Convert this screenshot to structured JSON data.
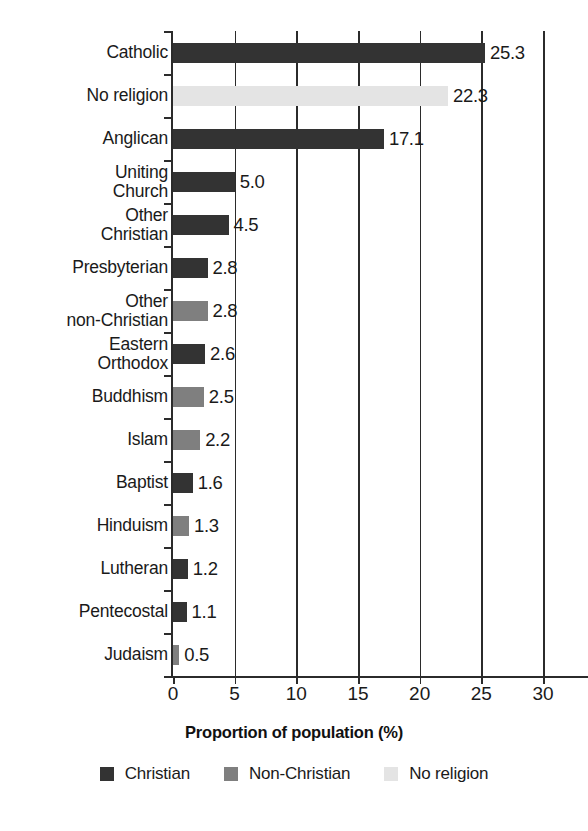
{
  "chart_data": {
    "type": "bar",
    "orientation": "horizontal",
    "title": "",
    "xlabel": "Proportion of population (%)",
    "ylabel": "",
    "xlim": [
      0,
      30
    ],
    "xticks": [
      "0",
      "5",
      "10",
      "15",
      "20",
      "25",
      "30"
    ],
    "grid": true,
    "legend_position": "bottom",
    "categories": [
      "Catholic",
      "No religion",
      "Anglican",
      "Uniting\nChurch",
      "Other\nChristian",
      "Presbyterian",
      "Other\nnon-Christian",
      "Eastern\nOrthodox",
      "Buddhism",
      "Islam",
      "Baptist",
      "Hinduism",
      "Lutheran",
      "Pentecostal",
      "Judaism"
    ],
    "values": [
      25.3,
      22.3,
      17.1,
      5.0,
      4.5,
      2.8,
      2.8,
      2.6,
      2.5,
      2.2,
      1.6,
      1.3,
      1.2,
      1.1,
      0.5
    ],
    "value_labels": [
      "25.3",
      "22.3",
      "17.1",
      "5.0",
      "4.5",
      "2.8",
      "2.8",
      "2.6",
      "2.5",
      "2.2",
      "1.6",
      "1.3",
      "1.2",
      "1.1",
      "0.5"
    ],
    "groups": [
      "Christian",
      "No religion",
      "Christian",
      "Christian",
      "Christian",
      "Christian",
      "Non-Christian",
      "Christian",
      "Non-Christian",
      "Non-Christian",
      "Christian",
      "Non-Christian",
      "Christian",
      "Christian",
      "Non-Christian"
    ],
    "legend": [
      {
        "label": "Christian",
        "color": "#333333",
        "key": "christian"
      },
      {
        "label": "Non-Christian",
        "color": "#7f7f7f",
        "key": "nonchristian"
      },
      {
        "label": "No religion",
        "color": "#e4e4e4",
        "key": "noreligion"
      }
    ],
    "colors": {
      "christian": "#333333",
      "nonchristian": "#7f7f7f",
      "noreligion": "#e4e4e4",
      "axis": "#2b2b2b",
      "text": "#1a1a1a",
      "background": "#ffffff"
    }
  }
}
